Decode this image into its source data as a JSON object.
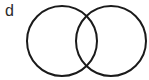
{
  "figure": {
    "kind": "venn-two-circles-diagram",
    "panel_label": "d",
    "background_color": "#ffffff",
    "stroke_color": "#1a1a1a",
    "stroke_width": 2,
    "fill": "none",
    "width": 149,
    "height": 80,
    "shapes": [
      {
        "name": "left-circle",
        "type": "circle",
        "cx": 62,
        "cy": 41,
        "r": 35,
        "label": ""
      },
      {
        "name": "right-circle",
        "type": "circle",
        "cx": 111,
        "cy": 41,
        "r": 35,
        "label": ""
      }
    ],
    "intersection": {
      "name": "lens-overlap",
      "top_point_x": 87,
      "top_point_y": 14,
      "bottom_point_x": 87,
      "bottom_point_y": 68,
      "label": ""
    }
  }
}
